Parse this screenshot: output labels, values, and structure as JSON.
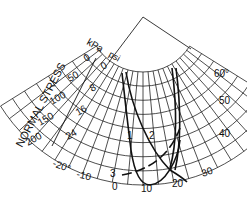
{
  "diagram": {
    "axis_title": "NORMAL STRESS",
    "unit_kpa": "kPa",
    "unit_psi": "psi",
    "kpa_ticks": [
      "0",
      "50",
      "100",
      "150",
      "200"
    ],
    "psi_ticks": [
      "0",
      "8",
      "16",
      "24"
    ],
    "bottom_ticks": [
      "-20°",
      "-10",
      "0",
      "10",
      "20",
      "30"
    ],
    "right_ticks": [
      "60°",
      "50",
      "40"
    ],
    "curve_labels": [
      "1",
      "2",
      "3"
    ],
    "colors": {
      "line": "#111111",
      "grid": "#222222",
      "background": "#ffffff"
    }
  }
}
